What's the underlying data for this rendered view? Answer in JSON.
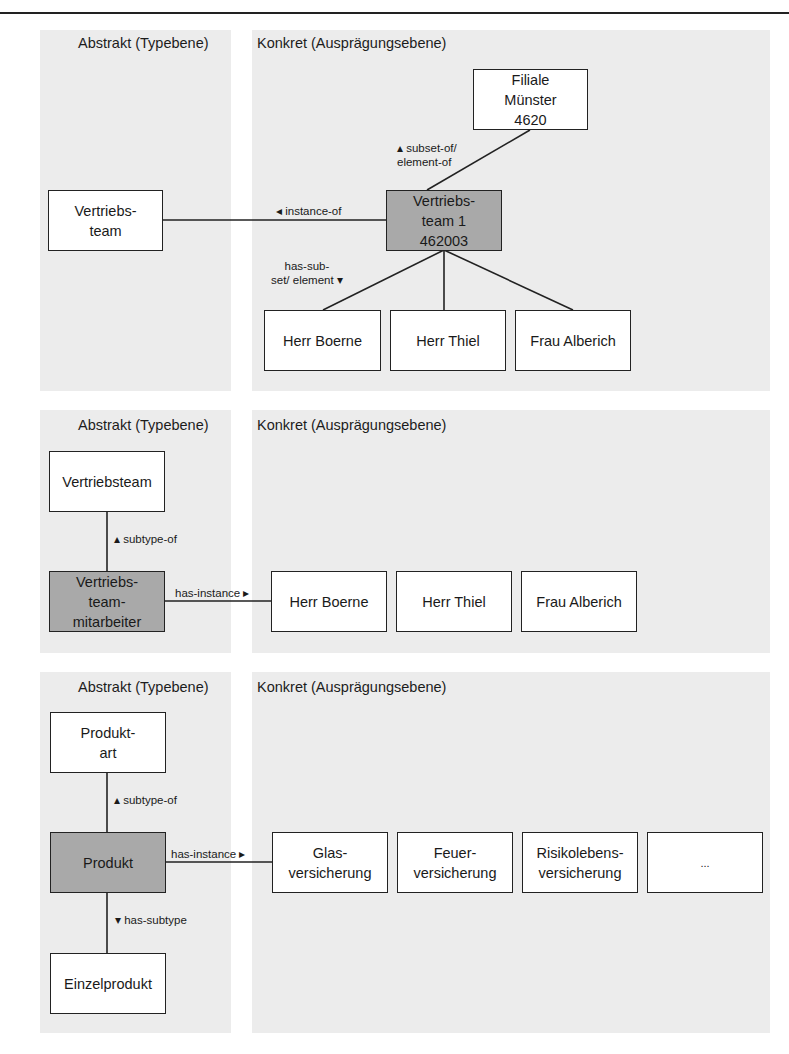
{
  "headings": {
    "abstract": "Abstrakt (Typebene)",
    "concrete": "Konkret (Ausprägungsebene)"
  },
  "diagram1": {
    "type_box": "Vertriebs-\nteam",
    "instance_box": "Vertriebs-\nteam 1\n462003",
    "parent_box": "Filiale\nMünster\n4620",
    "members": [
      "Herr Boerne",
      "Herr Thiel",
      "Frau Alberich"
    ],
    "rel_instance_of": "◂ instance-of",
    "rel_subset_of": "▴ subset-of/\nelement-of",
    "rel_has_subset": "has-sub-\nset/ element ▾"
  },
  "diagram2": {
    "supertype_box": "Vertriebsteam",
    "type_box": "Vertriebs-\nteam-\nmitarbeiter",
    "instances": [
      "Herr Boerne",
      "Herr Thiel",
      "Frau Alberich"
    ],
    "rel_subtype_of": "▴ subtype-of",
    "rel_has_instance": "has-instance ▸"
  },
  "diagram3": {
    "supertype_box": "Produkt-\nart",
    "type_box": "Produkt",
    "subtype_box": "Einzelprodukt",
    "instances": [
      "Glas-\nversicherung",
      "Feuer-\nversicherung",
      "Risikolebens-\nversicherung",
      "..."
    ],
    "rel_subtype_of": "▴ subtype-of",
    "rel_has_instance": "has-instance ▸",
    "rel_has_subtype": "▾ has-subtype"
  },
  "colors": {
    "panel_bg": "#ececec",
    "highlight_box": "#a9a9a9",
    "line": "#222222"
  }
}
